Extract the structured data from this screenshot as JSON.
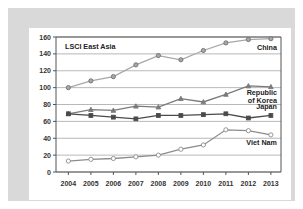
{
  "chart_data": {
    "type": "line",
    "title": "LSCI East Asia",
    "xlabel": "",
    "ylabel": "",
    "x": [
      2004,
      2005,
      2006,
      2007,
      2008,
      2009,
      2010,
      2011,
      2012,
      2013
    ],
    "categories": [
      "2004",
      "2005",
      "2006",
      "2007",
      "2008",
      "2009",
      "2010",
      "2011",
      "2012",
      "2013"
    ],
    "ylim": [
      0,
      160
    ],
    "yticks": [
      0,
      20,
      40,
      60,
      80,
      100,
      120,
      140,
      160
    ],
    "ytick_labels": [
      "0",
      "20",
      "40",
      "60",
      "80",
      "100",
      "120",
      "140",
      "160"
    ],
    "grid": true,
    "legend_position": "inline-right",
    "series": [
      {
        "name": "China",
        "label": "China",
        "color": "#a8a8a8",
        "marker": "circle",
        "values": [
          100,
          108,
          113,
          127,
          138,
          133,
          144,
          153,
          157,
          158
        ]
      },
      {
        "name": "Republic of Korea",
        "label": "Republic of Korea",
        "label_line1": "Republic",
        "label_line2": "of Korea",
        "color": "#7a7a7a",
        "marker": "triangle",
        "values": [
          69,
          74,
          73,
          78,
          77,
          87,
          83,
          92,
          102,
          101
        ]
      },
      {
        "name": "Japan",
        "label": "Japan",
        "color": "#4a4a4a",
        "marker": "square",
        "values": [
          69,
          67,
          65,
          63,
          67,
          67,
          68,
          69,
          64,
          67
        ]
      },
      {
        "name": "Viet Nam",
        "label": "Viet Nam",
        "color": "#8c8c8c",
        "marker": "open-circle",
        "values": [
          13,
          15,
          16,
          18,
          20,
          27,
          32,
          50,
          49,
          44
        ]
      }
    ]
  },
  "figure": {
    "background_color": "#d9d9d9",
    "card_color": "#ffffff",
    "axis_color": "#555555",
    "grid_color": "#9a9a9a"
  }
}
